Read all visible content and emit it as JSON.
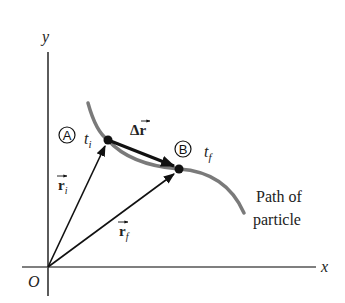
{
  "diagram": {
    "axes": {
      "x_label": "x",
      "y_label": "y",
      "origin_label": "O"
    },
    "points": [
      {
        "id": "A",
        "marker": "A",
        "time_label": "t",
        "time_subscript": "i"
      },
      {
        "id": "B",
        "marker": "B",
        "time_label": "t",
        "time_subscript": "f"
      }
    ],
    "vectors": {
      "initial_position": {
        "symbol": "r",
        "subscript": "i"
      },
      "final_position": {
        "symbol": "r",
        "subscript": "f"
      },
      "displacement": {
        "prefix": "Δ",
        "symbol": "r"
      }
    },
    "path_label": {
      "line1": "Path of",
      "line2": "particle"
    },
    "colors": {
      "path": "#7a7a7a",
      "vectors": "#111111",
      "axes": "#333333"
    }
  }
}
